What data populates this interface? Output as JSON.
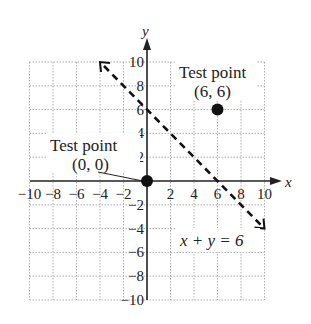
{
  "chart_data": {
    "type": "line",
    "title": "",
    "xlabel": "x",
    "ylabel": "y",
    "xlim": [
      -10,
      10
    ],
    "ylim": [
      -10,
      10
    ],
    "grid": true,
    "x_ticks": [
      -10,
      -8,
      -6,
      -4,
      -2,
      2,
      4,
      6,
      8,
      10
    ],
    "y_ticks": [
      10,
      8,
      6,
      4,
      2,
      -2,
      -4,
      -6,
      -8,
      -10
    ],
    "x_tick_labels": [
      "−10",
      "−8",
      "−6",
      "−4",
      "−2",
      "2",
      "4",
      "6",
      "8",
      "10"
    ],
    "y_tick_labels": [
      "10",
      "8",
      "6",
      "4",
      "2",
      "−2",
      "−4",
      "−6",
      "−8",
      "−10"
    ],
    "series": [
      {
        "name": "x + y = 6",
        "style": "dashed",
        "arrows": "both",
        "points": [
          [
            -4,
            10
          ],
          [
            10,
            -4
          ]
        ]
      }
    ],
    "points": [
      {
        "label": "Test point",
        "coords": "(0, 0)",
        "x": 0,
        "y": 0
      },
      {
        "label": "Test point",
        "coords": "(6, 6)",
        "x": 6,
        "y": 6
      }
    ],
    "annotations": [
      "Test point (0, 0)",
      "Test point (6, 6)",
      "x + y = 6"
    ]
  },
  "labels": {
    "x_axis": "x",
    "y_axis": "y",
    "test_point_a_title": "Test point",
    "test_point_a_coords": "(0, 0)",
    "test_point_b_title": "Test point",
    "test_point_b_coords": "(6, 6)",
    "equation": "x + y = 6"
  }
}
